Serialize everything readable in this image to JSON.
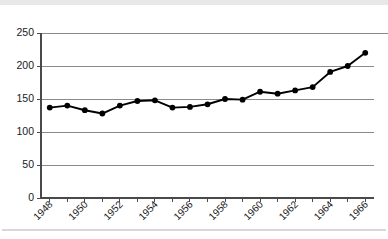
{
  "chart_data": {
    "type": "line",
    "title": "",
    "subtitle": "",
    "xlabel": "",
    "ylabel": "",
    "x": [
      1948,
      1949,
      1950,
      1951,
      1952,
      1953,
      1954,
      1955,
      1956,
      1957,
      1958,
      1959,
      1960,
      1961,
      1962,
      1963,
      1964,
      1965,
      1966
    ],
    "values": [
      137,
      140,
      133,
      128,
      140,
      147,
      148,
      137,
      138,
      142,
      150,
      149,
      161,
      158,
      163,
      168,
      191,
      200,
      220
    ],
    "series": [
      {
        "name": "",
        "values": [
          137,
          140,
          133,
          128,
          140,
          147,
          148,
          137,
          138,
          142,
          150,
          149,
          161,
          158,
          163,
          168,
          191,
          200,
          220
        ]
      }
    ],
    "xlim": [
      1947.5,
      1966.5
    ],
    "ylim": [
      0,
      250
    ],
    "ytick_labels": [
      "0",
      "50",
      "100",
      "150",
      "200",
      "250"
    ],
    "ytick_values": [
      0,
      50,
      100,
      150,
      200,
      250
    ],
    "xtick_values": [
      1948,
      1949,
      1950,
      1951,
      1952,
      1953,
      1954,
      1955,
      1956,
      1957,
      1958,
      1959,
      1960,
      1961,
      1962,
      1963,
      1964,
      1965,
      1966
    ],
    "xtick_labels": [
      "1948",
      "",
      "1950",
      "",
      "1952",
      "",
      "1954",
      "",
      "1956",
      "",
      "1958",
      "",
      "1960",
      "",
      "1962",
      "",
      "1964",
      "",
      "1966"
    ],
    "xtick_label_rotation": -45,
    "grid": "horizontal",
    "legend": "none",
    "marker": "filled-circle",
    "annotations": []
  },
  "style": {
    "line_color": "#000000",
    "marker_color": "#000000",
    "grid_color": "#8a8a8a",
    "axis_color": "#4a4a4a",
    "text_color": "#1a1a1a",
    "background": "#ffffff",
    "band_color": "#e8e8e8"
  }
}
